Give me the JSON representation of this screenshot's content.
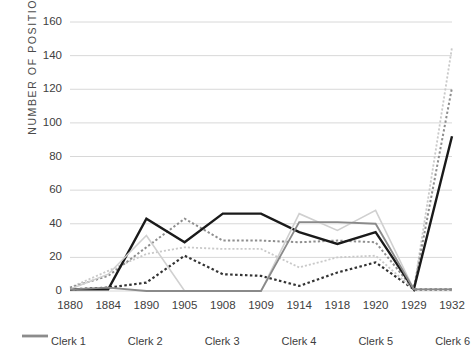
{
  "chart_data": {
    "type": "line",
    "title": "",
    "xlabel": "",
    "ylabel": "NUMBER OF POSITIONS",
    "categories": [
      "1880",
      "1884",
      "1890",
      "1905",
      "1908",
      "1909",
      "1914",
      "1918",
      "1920",
      "1929",
      "1932"
    ],
    "x": [
      1880,
      1884,
      1890,
      1905,
      1908,
      1909,
      1914,
      1918,
      1920,
      1929,
      1932
    ],
    "ylim": [
      0,
      160
    ],
    "yticks": [
      0,
      20,
      40,
      60,
      80,
      100,
      120,
      140,
      160
    ],
    "grid": "horizontal",
    "legend_position": "bottom",
    "series": [
      {
        "name": "Clerk 1",
        "style": "dotted",
        "color": "#333333",
        "width": 2.2,
        "values": [
          1,
          2,
          5,
          21,
          10,
          9,
          3,
          11,
          17,
          1,
          1
        ]
      },
      {
        "name": "Clerk 2",
        "style": "dotted",
        "color": "#c9c9c9",
        "width": 1.8,
        "values": [
          2,
          12,
          22,
          26,
          25,
          25,
          14,
          20,
          21,
          1,
          145
        ]
      },
      {
        "name": "Clerk 3",
        "style": "dotted",
        "color": "#8e8e8e",
        "width": 2.0,
        "values": [
          2,
          9,
          26,
          43,
          30,
          30,
          29,
          30,
          29,
          1,
          121
        ]
      },
      {
        "name": "Clerk 4",
        "style": "solid",
        "color": "#1a1a1a",
        "width": 2.4,
        "values": [
          1,
          1,
          43,
          29,
          46,
          46,
          35,
          28,
          35,
          1,
          92
        ]
      },
      {
        "name": "Clerk 5",
        "style": "solid",
        "color": "#d0d0d0",
        "width": 1.6,
        "values": [
          1,
          10,
          33,
          0,
          0,
          0,
          46,
          36,
          48,
          1,
          1
        ]
      },
      {
        "name": "Clerk 6",
        "style": "solid",
        "color": "#8a8a8a",
        "width": 1.8,
        "values": [
          1,
          2,
          0,
          0,
          0,
          0,
          41,
          41,
          40,
          1,
          1
        ]
      }
    ]
  },
  "axes": {
    "ylabel": "NUMBER OF POSITIONS",
    "ytick_labels": [
      "160",
      "140",
      "120",
      "100",
      "80",
      "60",
      "40",
      "20",
      "0"
    ],
    "xtick_labels": [
      "1880",
      "1884",
      "1890",
      "1905",
      "1908",
      "1909",
      "1914",
      "1918",
      "1920",
      "1929",
      "1932"
    ]
  },
  "legend": {
    "items": [
      {
        "label": "Clerk 1"
      },
      {
        "label": "Clerk 2"
      },
      {
        "label": "Clerk 3"
      },
      {
        "label": "Clerk 4"
      },
      {
        "label": "Clerk 5"
      },
      {
        "label": "Clerk 6"
      }
    ]
  },
  "colors": {
    "gridline": "#d8d8d8",
    "text": "#404040",
    "background": "#ffffff"
  }
}
